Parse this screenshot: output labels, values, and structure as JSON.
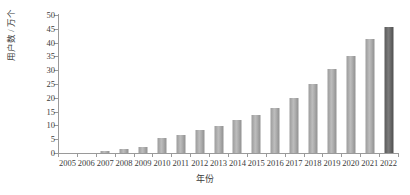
{
  "chart_data": {
    "type": "bar",
    "title": "",
    "subtitle": "",
    "xlabel": "年份",
    "ylabel": "用户数 / 万个",
    "ylim": [
      0,
      50
    ],
    "ytick_step": 5,
    "yticks": [
      0,
      5,
      10,
      15,
      20,
      25,
      30,
      35,
      40,
      45,
      50
    ],
    "ytick_labels": [
      "0",
      "5",
      "10",
      "15",
      "20",
      "25",
      "30",
      "35",
      "40",
      "45",
      "50"
    ],
    "grid": false,
    "legend": null,
    "legend_position": "none",
    "categories": [
      "2005",
      "2006",
      "2007",
      "2008",
      "2009",
      "2010",
      "2011",
      "2012",
      "2013",
      "2014",
      "2015",
      "2016",
      "2017",
      "2018",
      "2019",
      "2020",
      "2021",
      "2022"
    ],
    "values": [
      0,
      0,
      0.7,
      1.4,
      2.3,
      5.5,
      6.7,
      8.2,
      9.9,
      11.9,
      13.6,
      16.2,
      20.1,
      25.0,
      30.4,
      35.3,
      41.3,
      45.7
    ],
    "bar_colors": [
      "#b0b0b0",
      "#b0b0b0",
      "#b0b0b0",
      "#b0b0b0",
      "#b0b0b0",
      "#b0b0b0",
      "#b0b0b0",
      "#b0b0b0",
      "#b0b0b0",
      "#b0b0b0",
      "#b0b0b0",
      "#b0b0b0",
      "#b0b0b0",
      "#b0b0b0",
      "#b0b0b0",
      "#b0b0b0",
      "#b0b0b0",
      "#666666"
    ],
    "highlight_index": 17,
    "colors": {
      "bar_default": "#b0b0b0",
      "bar_highlight": "#666666",
      "axis": "#9a9a9a",
      "text": "#3b3b3b",
      "background": "#ffffff"
    }
  }
}
